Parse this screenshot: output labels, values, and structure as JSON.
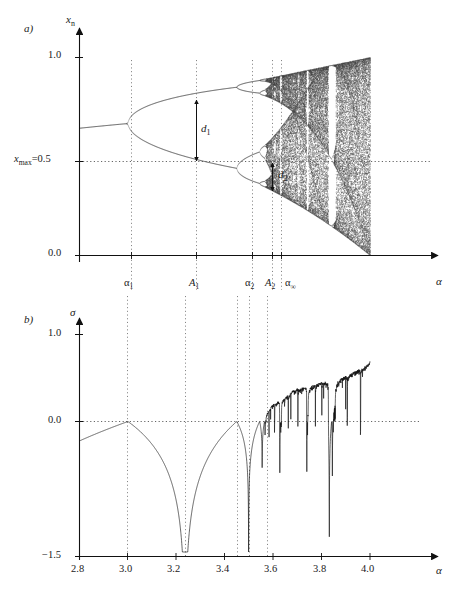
{
  "figure": {
    "panels": [
      {
        "tag": "a)",
        "name": "bifurcation-diagram",
        "y_axis_label": "x",
        "y_axis_label_sub": "n",
        "x_axis_label": "α",
        "y_ticks": [
          {
            "label": "1.0",
            "value": 1.0
          },
          {
            "label": "x",
            "sub": "max",
            "eq": "=0.5",
            "value": 0.5
          },
          {
            "label": "0.0",
            "value": 0.0
          }
        ],
        "x_ticks": [
          {
            "label": "α",
            "sub": "1",
            "value": 3.0
          },
          {
            "label": "A",
            "sub": "1",
            "value": 3.236
          },
          {
            "label": "α",
            "sub": "2",
            "value": 3.449
          },
          {
            "label": "A",
            "sub": "2",
            "value": 3.4985
          },
          {
            "label": "α",
            "sub": "∞",
            "value": 3.5699
          }
        ],
        "annotations": [
          {
            "label": "d",
            "sub": "1",
            "at_alpha": 3.236,
            "from": 0.809,
            "to": 0.5
          },
          {
            "label": "d",
            "sub": "2",
            "at_alpha": 3.4985,
            "from": 0.5,
            "to": 0.3737
          }
        ],
        "dotted_guide": {
          "y_value": 0.5,
          "label": "x_max=0.5"
        },
        "xlim": [
          2.8,
          4.05
        ],
        "ylim": [
          0.0,
          1.08
        ]
      },
      {
        "tag": "b)",
        "name": "lyapunov-exponent-plot",
        "y_axis_label": "σ",
        "x_axis_label": "α",
        "y_ticks": [
          {
            "label": "1.0",
            "value": 1.0
          },
          {
            "label": "0.0",
            "value": 0.0
          },
          {
            "label": "−1.5",
            "value": -1.5
          }
        ],
        "x_ticks": [
          {
            "label": "2.8",
            "value": 2.8
          },
          {
            "label": "3.0",
            "value": 3.0
          },
          {
            "label": "3.2",
            "value": 3.2
          },
          {
            "label": "3.4",
            "value": 3.4
          },
          {
            "label": "3.6",
            "value": 3.6
          },
          {
            "label": "3.8",
            "value": 3.8
          },
          {
            "label": "4.0",
            "value": 4.0
          }
        ],
        "xlim": [
          2.8,
          4.05
        ],
        "ylim": [
          -1.5,
          1.3
        ]
      }
    ]
  },
  "chart_data": [
    {
      "type": "scatter",
      "name": "logistic-map-bifurcation",
      "title": "",
      "xlabel": "α",
      "ylabel": "x_n",
      "xlim": [
        2.8,
        4.05
      ],
      "ylim": [
        0.0,
        1.08
      ],
      "grid": false,
      "map": "x_{n+1} = alpha * x_n * (1 - x_n)",
      "iterate_settings": {
        "transient": 300,
        "plotted": 180,
        "alpha_steps": 620
      },
      "reference_line_y": 0.5,
      "bifurcation_points": [
        {
          "label": "alpha_1",
          "alpha": 3.0,
          "period_after": 2
        },
        {
          "label": "alpha_2",
          "alpha": 3.449,
          "period_after": 4
        },
        {
          "label": "alpha_infinity",
          "alpha": 3.5699,
          "period_after": "chaos"
        }
      ],
      "superstable_points": [
        {
          "label": "A_1",
          "alpha": 3.236
        },
        {
          "label": "A_2",
          "alpha": 3.4985
        }
      ],
      "branch_distances": [
        {
          "label": "d_1",
          "alpha": 3.236,
          "upper_x": 0.809,
          "lower_x": 0.5,
          "value": 0.309
        },
        {
          "label": "d_2",
          "alpha": 3.4985,
          "upper_x": 0.5,
          "lower_x": 0.3737,
          "value": 0.1263
        }
      ],
      "periodic_windows": [
        {
          "period": 3,
          "alpha_start": 3.8284,
          "alpha_end": 3.8415
        },
        {
          "period": 5,
          "alpha_start": 3.7382,
          "alpha_end": 3.7441
        },
        {
          "period": 6,
          "alpha_start": 3.6265,
          "alpha_end": 3.6304
        }
      ]
    },
    {
      "type": "line",
      "name": "lyapunov-exponent",
      "title": "",
      "xlabel": "α",
      "ylabel": "σ",
      "xlim": [
        2.8,
        4.05
      ],
      "ylim": [
        -1.5,
        1.3
      ],
      "grid": false,
      "reference_line_y": 0.0,
      "definition": "sigma = lim (1/N) sum ln |alpha (1 - 2 x_n)|",
      "key_points": [
        {
          "alpha": 2.8,
          "sigma": -0.22
        },
        {
          "alpha": 3.0,
          "sigma": 0.0
        },
        {
          "alpha": 3.1,
          "sigma": -0.35
        },
        {
          "alpha": 3.2,
          "sigma": -0.66
        },
        {
          "alpha": 3.236,
          "sigma": -1.5
        },
        {
          "alpha": 3.3,
          "sigma": -0.82
        },
        {
          "alpha": 3.4,
          "sigma": -0.33
        },
        {
          "alpha": 3.449,
          "sigma": -0.02
        },
        {
          "alpha": 3.4985,
          "sigma": -1.5
        },
        {
          "alpha": 3.54,
          "sigma": -0.33
        },
        {
          "alpha": 3.5699,
          "sigma": 0.0
        },
        {
          "alpha": 3.6,
          "sigma": 0.18
        },
        {
          "alpha": 3.7,
          "sigma": 0.35
        },
        {
          "alpha": 3.8,
          "sigma": 0.41
        },
        {
          "alpha": 3.8284,
          "sigma": -1.3
        },
        {
          "alpha": 3.9,
          "sigma": 0.5
        },
        {
          "alpha": 4.0,
          "sigma": 0.693
        }
      ]
    }
  ]
}
